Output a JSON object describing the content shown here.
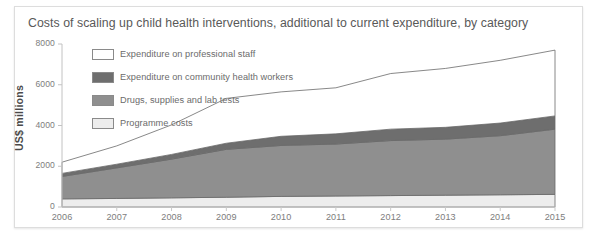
{
  "card": {
    "title": "Costs of scaling up child health interventions, additional to current expenditure, by category"
  },
  "chart_data": {
    "type": "area",
    "title": "Costs of scaling up child health interventions, additional to current expenditure, by category",
    "subtitle": "",
    "xlabel": "",
    "ylabel": "US$ millions",
    "stacked": true,
    "grid": false,
    "legend_position": "top-left-inside",
    "xlim": [
      2006,
      2015
    ],
    "ylim": [
      0,
      8000
    ],
    "categories": [
      "2006",
      "2007",
      "2008",
      "2009",
      "2010",
      "2011",
      "2012",
      "2013",
      "2014",
      "2015"
    ],
    "x": [
      2006,
      2007,
      2008,
      2009,
      2010,
      2011,
      2012,
      2013,
      2014,
      2015
    ],
    "yticks": [
      0,
      2000,
      4000,
      6000,
      8000
    ],
    "xticks": [
      "2006",
      "2007",
      "2008",
      "2009",
      "2010",
      "2011",
      "2012",
      "2013",
      "2014",
      "2015"
    ],
    "series": [
      {
        "name": "Programme costs",
        "color": "#ededed",
        "values": [
          400,
          420,
          450,
          480,
          520,
          540,
          560,
          580,
          600,
          620
        ]
      },
      {
        "name": "Drugs, supplies and lab tests",
        "color": "#8f8f8f",
        "values": [
          1100,
          1500,
          1900,
          2350,
          2500,
          2550,
          2700,
          2750,
          2900,
          3200
        ]
      },
      {
        "name": "Expenditure on community health workers",
        "color": "#6e6e6e",
        "values": [
          150,
          180,
          230,
          300,
          450,
          500,
          560,
          580,
          620,
          650
        ]
      },
      {
        "name": "Expenditure on professional staff",
        "color": "#ffffff",
        "values": [
          550,
          900,
          1450,
          2200,
          2180,
          2260,
          2730,
          2890,
          3080,
          3230
        ]
      }
    ],
    "totals": [
      2200,
      3000,
      4030,
      5330,
      5650,
      5850,
      6550,
      6800,
      7200,
      7700
    ]
  },
  "legend": {
    "items": [
      {
        "label": "Expenditure on professional staff",
        "color": "#ffffff"
      },
      {
        "label": "Expenditure on community health workers",
        "color": "#6e6e6e"
      },
      {
        "label": "Drugs, supplies and lab tests",
        "color": "#8f8f8f"
      },
      {
        "label": "Programme costs",
        "color": "#ededed"
      }
    ]
  }
}
